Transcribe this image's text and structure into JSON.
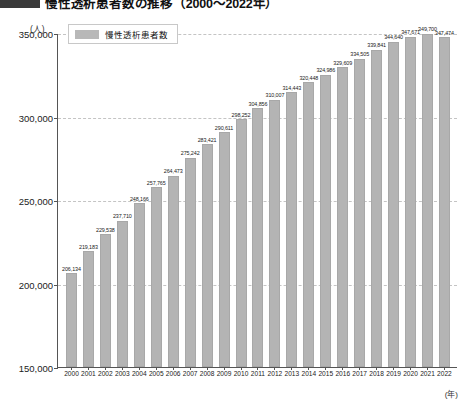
{
  "header": {
    "badge": "図表",
    "title": "慢性透析患者数の推移（2000〜2022年）"
  },
  "axis_units": {
    "y_unit": "(人)",
    "x_unit": "(年)"
  },
  "legend": {
    "items": [
      {
        "label": "慢性透析患者数",
        "color": "#b4b4b4"
      }
    ]
  },
  "chart_data": {
    "type": "bar",
    "title": "慢性透析患者数の推移（2000〜2022年）",
    "xlabel": "(年)",
    "ylabel": "(人)",
    "ylim": [
      150000,
      350000
    ],
    "yticks": [
      150000,
      200000,
      250000,
      300000,
      350000
    ],
    "ytick_labels": [
      "150,000",
      "200,000",
      "250,000",
      "300,000",
      "350,000"
    ],
    "grid": true,
    "legend_position": "top-left",
    "bar_color": "#b4b4b4",
    "categories": [
      "2000",
      "2001",
      "2002",
      "2003",
      "2004",
      "2005",
      "2006",
      "2007",
      "2008",
      "2009",
      "2010",
      "2011",
      "2012",
      "2013",
      "2014",
      "2015",
      "2016",
      "2017",
      "2018",
      "2019",
      "2020",
      "2021",
      "2022"
    ],
    "values": [
      206134,
      219183,
      229538,
      237710,
      248166,
      257765,
      264473,
      275242,
      283421,
      290611,
      298252,
      304856,
      310007,
      314443,
      320448,
      324986,
      329609,
      334505,
      339841,
      344640,
      347671,
      349700,
      347474
    ],
    "value_labels": [
      "206,134",
      "219,183",
      "229,538",
      "237,710",
      "248,166",
      "257,765",
      "264,473",
      "275,242",
      "283,421",
      "290,611",
      "298,252",
      "304,856",
      "310,007",
      "314,443",
      "320,448",
      "324,986",
      "329,609",
      "334,505",
      "339,841",
      "344,640",
      "347,671",
      "349,700",
      "347,474"
    ],
    "series": [
      {
        "name": "慢性透析患者数",
        "values": [
          206134,
          219183,
          229538,
          237710,
          248166,
          257765,
          264473,
          275242,
          283421,
          290611,
          298252,
          304856,
          310007,
          314443,
          320448,
          324986,
          329609,
          334505,
          339841,
          344640,
          347671,
          349700,
          347474
        ]
      }
    ]
  }
}
